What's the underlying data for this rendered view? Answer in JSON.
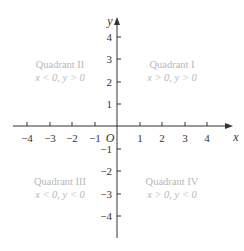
{
  "diagram": {
    "type": "cartesian-coordinate-plane",
    "axes": {
      "x_label": "x",
      "y_label": "y",
      "origin_label": "O",
      "x_ticks": [
        "−4",
        "−3",
        "−2",
        "−1",
        "1",
        "2",
        "3",
        "4"
      ],
      "y_ticks_positive": [
        "4",
        "3",
        "2",
        "1"
      ],
      "y_ticks_negative": [
        "−1",
        "−2",
        "−3",
        "−4"
      ]
    },
    "quadrants": [
      {
        "title": "Quadrant I",
        "condition": "x > 0, y > 0"
      },
      {
        "title": "Quadrant II",
        "condition": "x < 0, y > 0"
      },
      {
        "title": "Quadrant III",
        "condition": "x < 0, y < 0"
      },
      {
        "title": "Quadrant IV",
        "condition": "x > 0, y < 0"
      }
    ],
    "colors": {
      "axis": "#333333",
      "quadrant_text": "#b8b8b8",
      "background": "#ffffff"
    }
  }
}
